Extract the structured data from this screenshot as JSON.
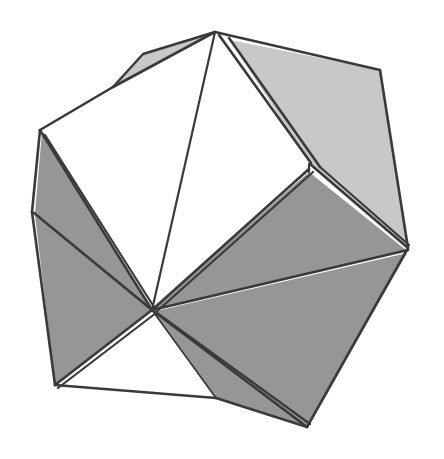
{
  "figure": {
    "kind": "polyhedron-illustration",
    "canvas": {
      "width": 444,
      "height": 459,
      "background": "#ffffff"
    },
    "palette": {
      "stroke": "#3a3a3a",
      "face_light": "#c8c8c8",
      "face_mid": "#969696",
      "face_white": "#ffffff"
    },
    "stroke_width": 2.6,
    "vertices": {
      "apex": [
        215,
        32
      ],
      "upper_left_fold": [
        113,
        87
      ],
      "left_upper": [
        40,
        130
      ],
      "left_mid": [
        32,
        212
      ],
      "left_lower": [
        55,
        385
      ],
      "bottom": [
        216,
        398
      ],
      "bottom_right": [
        307,
        427
      ],
      "right": [
        408,
        248
      ],
      "upper_right": [
        380,
        70
      ],
      "inner_right": [
        308,
        165
      ],
      "center": [
        152,
        310
      ],
      "sliver_inner": [
        222,
        44
      ],
      "sliver_outer": [
        232,
        40
      ]
    },
    "faces": [
      {
        "name": "sliver-top-left",
        "shade": "#c8c8c8",
        "points": "113,87 145,52 215,32 130,78"
      },
      {
        "name": "upper-left-white",
        "shade": "#ffffff",
        "points": "40,130 113,87 215,32 152,310"
      },
      {
        "name": "left-dark-upper",
        "shade": "#969696",
        "points": "40,130 152,310 36,214"
      },
      {
        "name": "left-dark-lower",
        "shade": "#969696",
        "points": "36,214 152,310 55,385"
      },
      {
        "name": "upper-right-light",
        "shade": "#c8c8c8",
        "points": "232,40 380,70 408,248 308,165"
      },
      {
        "name": "right-dark-upper",
        "shade": "#969696",
        "points": "308,171 408,252 152,310"
      },
      {
        "name": "right-dark-lower",
        "shade": "#969696",
        "points": "152,310 408,252 307,427 216,398"
      },
      {
        "name": "bottom-white",
        "shade": "#ffffff",
        "points": "152,310 55,385 216,398"
      }
    ],
    "edges": [
      {
        "name": "outline-apex-to-upper-right",
        "path": "M215,32 L380,70"
      },
      {
        "name": "outline-upper-right-to-right",
        "path": "M380,70 L408,248"
      },
      {
        "name": "outline-right-to-bottom-right",
        "path": "M408,248 L307,427"
      },
      {
        "name": "outline-bottom-right-to-bottom",
        "path": "M307,427 L216,398"
      },
      {
        "name": "outline-bottom-to-left-lower",
        "path": "M216,398 L55,385"
      },
      {
        "name": "outline-left-lower-to-left-mid",
        "path": "M55,385 L32,212"
      },
      {
        "name": "outline-left-mid-to-left-upper",
        "path": "M32,212 L40,130"
      },
      {
        "name": "outline-left-upper-to-fold",
        "path": "M40,130 L113,87"
      },
      {
        "name": "outline-fold-to-apex",
        "path": "M113,87 L215,32"
      },
      {
        "name": "sliver-top-left-lower",
        "path": "M113,87 L145,52 L215,32"
      },
      {
        "name": "apex-to-center",
        "path": "M215,32 L152,310"
      },
      {
        "name": "apex-to-inner-right-a",
        "path": "M218,36 L308,165"
      },
      {
        "name": "apex-to-inner-right-b",
        "path": "M226,38 L317,166"
      },
      {
        "name": "inner-right-to-right-upper",
        "path": "M308,165 L408,248"
      },
      {
        "name": "inner-right-to-center",
        "path": "M308,171 L152,310"
      },
      {
        "name": "center-to-right",
        "path": "M152,310 L408,252"
      },
      {
        "name": "center-to-bottom-right",
        "path": "M152,310 L307,427"
      },
      {
        "name": "center-to-bottom",
        "path": "M152,310 L216,398"
      },
      {
        "name": "center-to-left-lower",
        "path": "M152,310 L55,385"
      },
      {
        "name": "center-to-left-mid",
        "path": "M152,310 L36,214"
      },
      {
        "name": "center-to-left-upper",
        "path": "M152,310 L40,130"
      },
      {
        "name": "left-upper-to-center-inner",
        "path": "M45,134 L154,306"
      },
      {
        "name": "right-band-inner",
        "path": "M380,72 L316,168"
      }
    ]
  }
}
